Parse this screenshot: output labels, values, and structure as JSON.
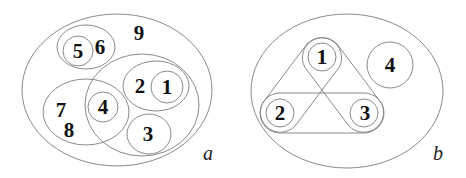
{
  "diagram_a": {
    "label": "a",
    "numbers": {
      "n1": "1",
      "n2": "2",
      "n3": "3",
      "n4": "4",
      "n5": "5",
      "n6": "6",
      "n7": "7",
      "n8": "8",
      "n9": "9"
    }
  },
  "diagram_b": {
    "label": "b",
    "numbers": {
      "n1": "1",
      "n2": "2",
      "n3": "3",
      "n4": "4"
    }
  },
  "colors": {
    "stroke": "#8a8a8a",
    "text": "#111111",
    "background": "#ffffff"
  }
}
